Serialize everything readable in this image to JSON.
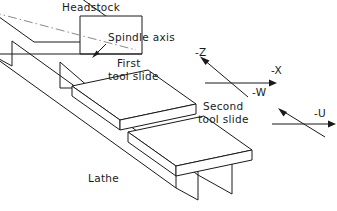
{
  "diagram": {
    "canvas": {
      "width": 337,
      "height": 211,
      "background": "#ffffff"
    },
    "line_color": "#1a1a1a",
    "centerline_color": "#8a8a8a",
    "labels": {
      "headstock": "Headstock",
      "spindle_axis": "Spindle axis",
      "first_tool_slide_line1": "First",
      "first_tool_slide_line2": "tool slide",
      "second_tool_slide_line1": "Second",
      "second_tool_slide_line2": "tool slide",
      "lathe": "Lathe"
    },
    "axes": [
      {
        "name": "axis-z",
        "label": "-Z",
        "direction": "up-left",
        "group": "upper"
      },
      {
        "name": "axis-x",
        "label": "-X",
        "direction": "right",
        "group": "upper"
      },
      {
        "name": "axis-w",
        "label": "-W",
        "direction": "down-right",
        "group": "upper"
      },
      {
        "name": "axis-u",
        "label": "-U",
        "direction": "right",
        "group": "lower"
      },
      {
        "name": "axis-lower-diagonal",
        "label": "",
        "direction": "up-left",
        "group": "lower"
      }
    ],
    "components": [
      {
        "name": "headstock-block",
        "label": "Headstock"
      },
      {
        "name": "lathe-bed",
        "label": "Lathe"
      },
      {
        "name": "first-tool-slide",
        "label": "First tool slide"
      },
      {
        "name": "second-tool-slide",
        "label": "Second tool slide"
      },
      {
        "name": "spindle-centerline",
        "label": "Spindle axis"
      }
    ]
  }
}
